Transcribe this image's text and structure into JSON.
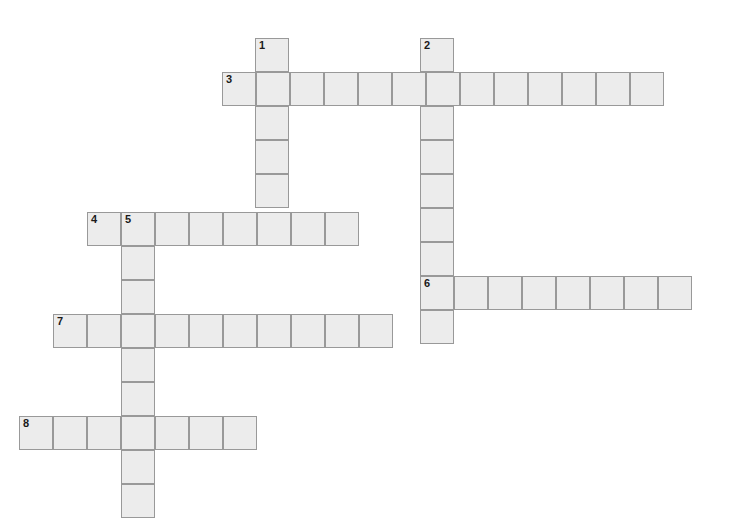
{
  "puzzle": {
    "title": "Crossword Grid",
    "type": "crossword-grid",
    "canvas": {
      "width": 729,
      "height": 523,
      "background": "#ffffff"
    },
    "cell": {
      "size": 34,
      "fill": "#ececec",
      "border_color": "#999999",
      "border_width": 1.5,
      "number_color": "#1a1a1a"
    },
    "entries": [
      {
        "number": "1",
        "direction": "down",
        "length": 6,
        "start": {
          "x": 255,
          "y": 38
        },
        "cells": [
          {
            "x": 255,
            "y": 38,
            "number": "1"
          },
          {
            "x": 255,
            "y": 72,
            "number": ""
          },
          {
            "x": 255,
            "y": 106,
            "number": ""
          },
          {
            "x": 255,
            "y": 140,
            "number": ""
          },
          {
            "x": 255,
            "y": 174,
            "number": ""
          },
          {
            "x": 255,
            "y": 208,
            "number": ""
          }
        ]
      },
      {
        "number": "2",
        "direction": "down",
        "length": 9,
        "start": {
          "x": 420,
          "y": 38
        },
        "cells": [
          {
            "x": 420,
            "y": 38,
            "number": "2"
          },
          {
            "x": 420,
            "y": 72,
            "number": ""
          },
          {
            "x": 420,
            "y": 106,
            "number": ""
          },
          {
            "x": 420,
            "y": 140,
            "number": ""
          },
          {
            "x": 420,
            "y": 174,
            "number": ""
          },
          {
            "x": 420,
            "y": 208,
            "number": ""
          },
          {
            "x": 420,
            "y": 242,
            "number": ""
          },
          {
            "x": 420,
            "y": 276,
            "number": "6"
          },
          {
            "x": 420,
            "y": 310,
            "number": ""
          }
        ]
      },
      {
        "number": "3",
        "direction": "across",
        "length": 13,
        "start": {
          "x": 222,
          "y": 72
        },
        "cells": [
          {
            "x": 222,
            "y": 72,
            "number": "3"
          },
          {
            "x": 256,
            "y": 72,
            "number": ""
          },
          {
            "x": 290,
            "y": 72,
            "number": ""
          },
          {
            "x": 324,
            "y": 72,
            "number": ""
          },
          {
            "x": 358,
            "y": 72,
            "number": ""
          },
          {
            "x": 392,
            "y": 72,
            "number": ""
          },
          {
            "x": 426,
            "y": 72,
            "number": ""
          },
          {
            "x": 460,
            "y": 72,
            "number": ""
          },
          {
            "x": 494,
            "y": 72,
            "number": ""
          },
          {
            "x": 528,
            "y": 72,
            "number": ""
          },
          {
            "x": 562,
            "y": 72,
            "number": ""
          },
          {
            "x": 596,
            "y": 72,
            "number": ""
          },
          {
            "x": 630,
            "y": 72,
            "number": ""
          }
        ]
      },
      {
        "number": "4",
        "direction": "across",
        "length": 8,
        "start": {
          "x": 87,
          "y": 212
        },
        "cells": [
          {
            "x": 87,
            "y": 212,
            "number": "4"
          },
          {
            "x": 121,
            "y": 212,
            "number": "5"
          },
          {
            "x": 155,
            "y": 212,
            "number": ""
          },
          {
            "x": 189,
            "y": 212,
            "number": ""
          },
          {
            "x": 223,
            "y": 212,
            "number": ""
          },
          {
            "x": 257,
            "y": 212,
            "number": ""
          },
          {
            "x": 291,
            "y": 212,
            "number": ""
          },
          {
            "x": 325,
            "y": 212,
            "number": ""
          }
        ]
      },
      {
        "number": "5",
        "direction": "down",
        "length": 9,
        "start": {
          "x": 121,
          "y": 212
        },
        "cells": [
          {
            "x": 121,
            "y": 212,
            "number": "5"
          },
          {
            "x": 121,
            "y": 246,
            "number": ""
          },
          {
            "x": 121,
            "y": 280,
            "number": ""
          },
          {
            "x": 121,
            "y": 314,
            "number": ""
          },
          {
            "x": 121,
            "y": 348,
            "number": ""
          },
          {
            "x": 121,
            "y": 382,
            "number": ""
          },
          {
            "x": 121,
            "y": 416,
            "number": ""
          },
          {
            "x": 121,
            "y": 450,
            "number": ""
          },
          {
            "x": 121,
            "y": 484,
            "number": ""
          }
        ]
      },
      {
        "number": "6",
        "direction": "across",
        "length": 8,
        "start": {
          "x": 420,
          "y": 276
        },
        "cells": [
          {
            "x": 420,
            "y": 276,
            "number": "6"
          },
          {
            "x": 454,
            "y": 276,
            "number": ""
          },
          {
            "x": 488,
            "y": 276,
            "number": ""
          },
          {
            "x": 522,
            "y": 276,
            "number": ""
          },
          {
            "x": 556,
            "y": 276,
            "number": ""
          },
          {
            "x": 590,
            "y": 276,
            "number": ""
          },
          {
            "x": 624,
            "y": 276,
            "number": ""
          },
          {
            "x": 658,
            "y": 276,
            "number": ""
          }
        ]
      },
      {
        "number": "7",
        "direction": "across",
        "length": 10,
        "start": {
          "x": 53,
          "y": 314
        },
        "cells": [
          {
            "x": 53,
            "y": 314,
            "number": "7"
          },
          {
            "x": 87,
            "y": 314,
            "number": ""
          },
          {
            "x": 121,
            "y": 314,
            "number": ""
          },
          {
            "x": 155,
            "y": 314,
            "number": ""
          },
          {
            "x": 189,
            "y": 314,
            "number": ""
          },
          {
            "x": 223,
            "y": 314,
            "number": ""
          },
          {
            "x": 257,
            "y": 314,
            "number": ""
          },
          {
            "x": 291,
            "y": 314,
            "number": ""
          },
          {
            "x": 325,
            "y": 314,
            "number": ""
          },
          {
            "x": 359,
            "y": 314,
            "number": ""
          }
        ]
      },
      {
        "number": "8",
        "direction": "across",
        "length": 7,
        "start": {
          "x": 19,
          "y": 416
        },
        "cells": [
          {
            "x": 19,
            "y": 416,
            "number": "8"
          },
          {
            "x": 53,
            "y": 416,
            "number": ""
          },
          {
            "x": 87,
            "y": 416,
            "number": ""
          },
          {
            "x": 121,
            "y": 416,
            "number": ""
          },
          {
            "x": 155,
            "y": 416,
            "number": ""
          },
          {
            "x": 189,
            "y": 416,
            "number": ""
          },
          {
            "x": 223,
            "y": 416,
            "number": ""
          }
        ]
      }
    ],
    "cells": [
      {
        "x": 255,
        "y": 38,
        "number": "1",
        "letter": ""
      },
      {
        "x": 420,
        "y": 38,
        "number": "2",
        "letter": ""
      },
      {
        "x": 222,
        "y": 72,
        "number": "3",
        "letter": ""
      },
      {
        "x": 256,
        "y": 72,
        "number": "",
        "letter": ""
      },
      {
        "x": 290,
        "y": 72,
        "number": "",
        "letter": ""
      },
      {
        "x": 324,
        "y": 72,
        "number": "",
        "letter": ""
      },
      {
        "x": 358,
        "y": 72,
        "number": "",
        "letter": ""
      },
      {
        "x": 392,
        "y": 72,
        "number": "",
        "letter": ""
      },
      {
        "x": 426,
        "y": 72,
        "number": "",
        "letter": ""
      },
      {
        "x": 460,
        "y": 72,
        "number": "",
        "letter": ""
      },
      {
        "x": 494,
        "y": 72,
        "number": "",
        "letter": ""
      },
      {
        "x": 528,
        "y": 72,
        "number": "",
        "letter": ""
      },
      {
        "x": 562,
        "y": 72,
        "number": "",
        "letter": ""
      },
      {
        "x": 596,
        "y": 72,
        "number": "",
        "letter": ""
      },
      {
        "x": 630,
        "y": 72,
        "number": "",
        "letter": ""
      },
      {
        "x": 255,
        "y": 106,
        "number": "",
        "letter": ""
      },
      {
        "x": 420,
        "y": 106,
        "number": "",
        "letter": ""
      },
      {
        "x": 255,
        "y": 140,
        "number": "",
        "letter": ""
      },
      {
        "x": 420,
        "y": 140,
        "number": "",
        "letter": ""
      },
      {
        "x": 255,
        "y": 174,
        "number": "",
        "letter": ""
      },
      {
        "x": 420,
        "y": 174,
        "number": "",
        "letter": ""
      },
      {
        "x": 87,
        "y": 212,
        "number": "4",
        "letter": ""
      },
      {
        "x": 121,
        "y": 212,
        "number": "5",
        "letter": ""
      },
      {
        "x": 155,
        "y": 212,
        "number": "",
        "letter": ""
      },
      {
        "x": 189,
        "y": 212,
        "number": "",
        "letter": ""
      },
      {
        "x": 223,
        "y": 212,
        "number": "",
        "letter": ""
      },
      {
        "x": 257,
        "y": 212,
        "number": "",
        "letter": ""
      },
      {
        "x": 291,
        "y": 212,
        "number": "",
        "letter": ""
      },
      {
        "x": 325,
        "y": 212,
        "number": "",
        "letter": ""
      },
      {
        "x": 420,
        "y": 208,
        "number": "",
        "letter": ""
      },
      {
        "x": 121,
        "y": 246,
        "number": "",
        "letter": ""
      },
      {
        "x": 420,
        "y": 242,
        "number": "",
        "letter": ""
      },
      {
        "x": 121,
        "y": 280,
        "number": "",
        "letter": ""
      },
      {
        "x": 420,
        "y": 276,
        "number": "6",
        "letter": ""
      },
      {
        "x": 454,
        "y": 276,
        "number": "",
        "letter": ""
      },
      {
        "x": 488,
        "y": 276,
        "number": "",
        "letter": ""
      },
      {
        "x": 522,
        "y": 276,
        "number": "",
        "letter": ""
      },
      {
        "x": 556,
        "y": 276,
        "number": "",
        "letter": ""
      },
      {
        "x": 590,
        "y": 276,
        "number": "",
        "letter": ""
      },
      {
        "x": 624,
        "y": 276,
        "number": "",
        "letter": ""
      },
      {
        "x": 658,
        "y": 276,
        "number": "",
        "letter": ""
      },
      {
        "x": 53,
        "y": 314,
        "number": "7",
        "letter": ""
      },
      {
        "x": 87,
        "y": 314,
        "number": "",
        "letter": ""
      },
      {
        "x": 121,
        "y": 314,
        "number": "",
        "letter": ""
      },
      {
        "x": 155,
        "y": 314,
        "number": "",
        "letter": ""
      },
      {
        "x": 189,
        "y": 314,
        "number": "",
        "letter": ""
      },
      {
        "x": 223,
        "y": 314,
        "number": "",
        "letter": ""
      },
      {
        "x": 257,
        "y": 314,
        "number": "",
        "letter": ""
      },
      {
        "x": 291,
        "y": 314,
        "number": "",
        "letter": ""
      },
      {
        "x": 325,
        "y": 314,
        "number": "",
        "letter": ""
      },
      {
        "x": 359,
        "y": 314,
        "number": "",
        "letter": ""
      },
      {
        "x": 420,
        "y": 310,
        "number": "",
        "letter": ""
      },
      {
        "x": 121,
        "y": 348,
        "number": "",
        "letter": ""
      },
      {
        "x": 121,
        "y": 382,
        "number": "",
        "letter": ""
      },
      {
        "x": 19,
        "y": 416,
        "number": "8",
        "letter": ""
      },
      {
        "x": 53,
        "y": 416,
        "number": "",
        "letter": ""
      },
      {
        "x": 87,
        "y": 416,
        "number": "",
        "letter": ""
      },
      {
        "x": 121,
        "y": 416,
        "number": "",
        "letter": ""
      },
      {
        "x": 155,
        "y": 416,
        "number": "",
        "letter": ""
      },
      {
        "x": 189,
        "y": 416,
        "number": "",
        "letter": ""
      },
      {
        "x": 223,
        "y": 416,
        "number": "",
        "letter": ""
      },
      {
        "x": 121,
        "y": 450,
        "number": "",
        "letter": ""
      },
      {
        "x": 121,
        "y": 484,
        "number": "",
        "letter": ""
      }
    ]
  }
}
